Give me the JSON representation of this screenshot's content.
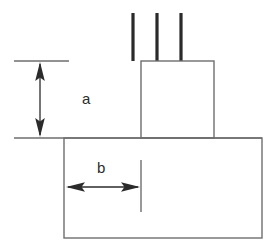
{
  "diagram": {
    "type": "engineering-line-diagram",
    "background_color": "#ffffff",
    "line_color": "#6e6e6e",
    "bar_color": "#2b2b2b",
    "dimension_color": "#2b2b2b",
    "labels": {
      "height_dimension": "a",
      "width_dimension": "b"
    },
    "shapes": {
      "footing": {
        "name": "footing-rectangle",
        "x": 64,
        "y": 138,
        "width": 198,
        "height": 100
      },
      "column": {
        "name": "column-rectangle",
        "x": 141,
        "y": 61,
        "width": 73,
        "height": 77
      },
      "footing_top_extension_line": {
        "name": "footing-top-line",
        "x1": 14,
        "y1": 138,
        "x2": 262,
        "y2": 138
      },
      "dowel_bars": [
        {
          "name": "dowel-bar-1",
          "x": 133,
          "y_top": 13,
          "y_bottom": 61,
          "thickness": 3
        },
        {
          "name": "dowel-bar-2",
          "x": 157,
          "y_top": 13,
          "y_bottom": 61,
          "thickness": 3
        },
        {
          "name": "dowel-bar-3",
          "x": 181,
          "y_top": 13,
          "y_bottom": 61,
          "thickness": 3
        }
      ]
    },
    "dimensions": {
      "height_a": {
        "name": "dimension-a",
        "label": "a",
        "orientation": "vertical",
        "arrow_x": 40,
        "arrow_y_top": 62,
        "arrow_y_bottom": 137,
        "extension_line": {
          "x1": 14,
          "y1": 61,
          "x2": 69,
          "y2": 61
        },
        "label_x": 88,
        "label_y": 99
      },
      "width_b": {
        "name": "dimension-b",
        "label": "b",
        "orientation": "horizontal",
        "arrow_y": 187,
        "arrow_x_left": 66,
        "arrow_x_right": 140,
        "extension_line": {
          "x1": 141,
          "y1": 160,
          "x2": 141,
          "y2": 212
        },
        "label_x": 103,
        "label_y": 168
      }
    }
  }
}
